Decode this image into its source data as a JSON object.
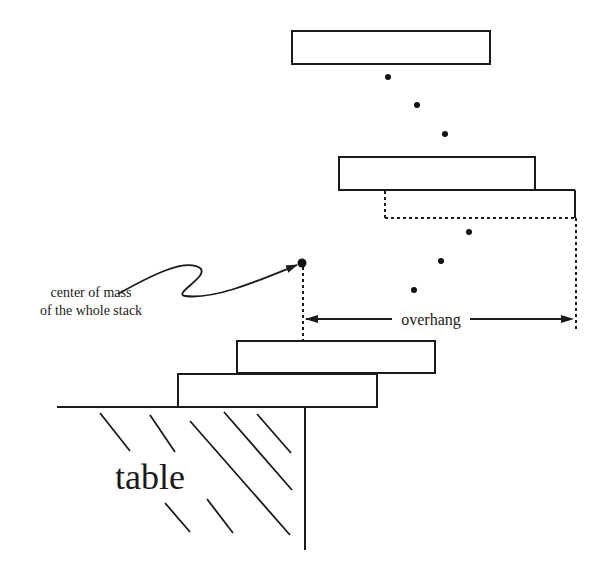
{
  "diagram": {
    "labels": {
      "center_of_mass_line1": "center of mass",
      "center_of_mass_line2": "of the whole stack",
      "overhang": "overhang",
      "table": "table"
    },
    "blocks": [
      {
        "id": "top-block",
        "x": 292,
        "y": 31,
        "w": 198,
        "h": 33,
        "style": "solid"
      },
      {
        "id": "upper-block",
        "x": 339,
        "y": 157,
        "w": 196,
        "h": 33,
        "style": "solid"
      },
      {
        "id": "ghost-block",
        "x": 385,
        "y": 190,
        "w": 190,
        "h": 29,
        "style": "dashed"
      },
      {
        "id": "lower-block-2",
        "x": 237,
        "y": 341,
        "w": 198,
        "h": 32,
        "style": "solid"
      },
      {
        "id": "lower-block-1",
        "x": 178,
        "y": 374,
        "w": 199,
        "h": 33,
        "style": "solid"
      }
    ],
    "ellipsis_dots": [
      {
        "x": 388,
        "y": 77
      },
      {
        "x": 417,
        "y": 105
      },
      {
        "x": 445,
        "y": 134
      },
      {
        "x": 469,
        "y": 232
      },
      {
        "x": 441,
        "y": 261
      },
      {
        "x": 414,
        "y": 290
      }
    ],
    "center_of_mass": {
      "x": 302,
      "y": 263
    },
    "colors": {
      "stroke": "#1a1a1a",
      "background": "#ffffff"
    }
  }
}
